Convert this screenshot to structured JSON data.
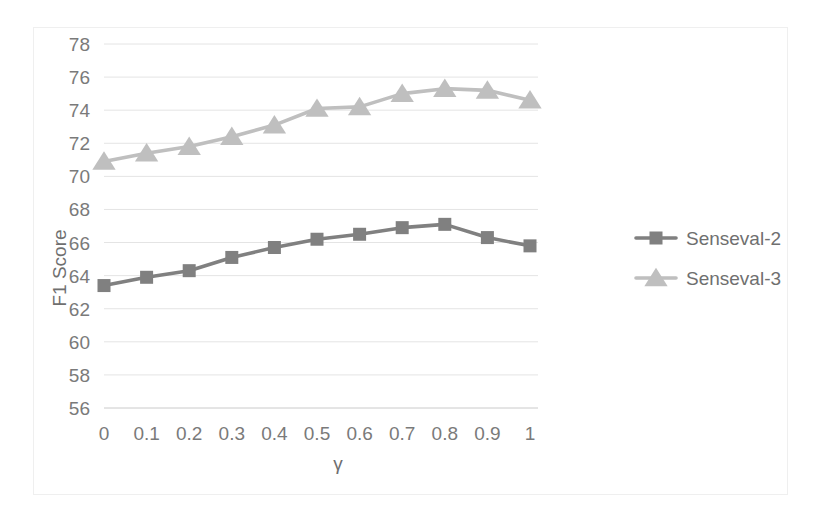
{
  "chart_data": {
    "type": "line",
    "title": "",
    "xlabel": "γ",
    "ylabel": "F1 Score",
    "x": [
      0,
      0.1,
      0.2,
      0.3,
      0.4,
      0.5,
      0.6,
      0.7,
      0.8,
      0.9,
      1
    ],
    "xtick_labels": [
      "0",
      "0.1",
      "0.2",
      "0.3",
      "0.4",
      "0.5",
      "0.6",
      "0.7",
      "0.8",
      "0.9",
      "1"
    ],
    "ytick_labels": [
      "56",
      "58",
      "60",
      "62",
      "64",
      "66",
      "68",
      "70",
      "72",
      "74",
      "76",
      "78"
    ],
    "ytick_values": [
      56,
      58,
      60,
      62,
      64,
      66,
      68,
      70,
      72,
      74,
      76,
      78
    ],
    "ylim": [
      55,
      79
    ],
    "xlim": [
      -0.05,
      1.05
    ],
    "grid": true,
    "grid_axis": "y",
    "legend_position": "right",
    "series": [
      {
        "name": "Senseval-2",
        "color": "#808080",
        "marker": "square",
        "values": [
          63.4,
          63.9,
          64.3,
          65.1,
          65.7,
          66.2,
          66.5,
          66.9,
          67.1,
          66.3,
          65.8
        ]
      },
      {
        "name": "Senseval-3",
        "color": "#bfbfbf",
        "marker": "triangle",
        "values": [
          70.9,
          71.4,
          71.8,
          72.4,
          73.1,
          74.1,
          74.2,
          75.0,
          75.3,
          75.2,
          74.6
        ]
      }
    ]
  },
  "legend": {
    "items": [
      {
        "label": "Senseval-2"
      },
      {
        "label": "Senseval-3"
      }
    ]
  },
  "axes": {
    "y_title": "F1 Score",
    "x_title": "γ"
  }
}
